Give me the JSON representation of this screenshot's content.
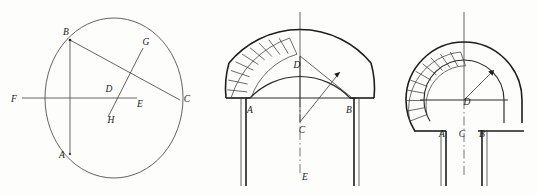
{
  "page": {
    "background": "#fdfdfc",
    "width": 537,
    "height": 195,
    "ink_color": "#1d1d1d",
    "hatch_color": "#3b3b3b"
  },
  "figures": [
    {
      "id": "figure-1-circle-chord-construction",
      "description": "Circle with chord BC, chord AB vertical, diameter line FE horizontal, and perpendicular bisector GH",
      "labels": [
        {
          "key": "A",
          "text": "A",
          "x": 62,
          "y": 158
        },
        {
          "key": "B",
          "text": "B",
          "x": 66,
          "y": 35
        },
        {
          "key": "C",
          "text": "C",
          "x": 187,
          "y": 102
        },
        {
          "key": "D",
          "text": "D",
          "x": 109,
          "y": 92
        },
        {
          "key": "E",
          "text": "E",
          "x": 140,
          "y": 107
        },
        {
          "key": "F",
          "text": "F",
          "x": 14,
          "y": 102
        },
        {
          "key": "G",
          "text": "G",
          "x": 146,
          "y": 45
        },
        {
          "key": "H",
          "text": "H",
          "x": 111,
          "y": 123
        }
      ]
    },
    {
      "id": "figure-2-segmental-arch",
      "description": "Segmental arch on piers, voussoirs hatched on left haunch, radius arrow from centre C, springing points A and B, crown D, vertical axis through E",
      "labels": [
        {
          "key": "A",
          "text": "A",
          "x": 250,
          "y": 113
        },
        {
          "key": "B",
          "text": "B",
          "x": 349,
          "y": 113
        },
        {
          "key": "C",
          "text": "C",
          "x": 302,
          "y": 133
        },
        {
          "key": "D",
          "text": "D",
          "x": 297,
          "y": 68
        },
        {
          "key": "E",
          "text": "E",
          "x": 305,
          "y": 180
        }
      ]
    },
    {
      "id": "figure-3-horseshoe-arch",
      "description": "Horseshoe (stilted) arch on piers with hatched voussoirs on left, centre D with radius arrow, springing A, axis C, springing B",
      "labels": [
        {
          "key": "A",
          "text": "A",
          "x": 442,
          "y": 137
        },
        {
          "key": "B",
          "text": "B",
          "x": 482,
          "y": 137
        },
        {
          "key": "C",
          "text": "C",
          "x": 462,
          "y": 137
        },
        {
          "key": "D",
          "text": "D",
          "x": 467,
          "y": 105
        }
      ]
    }
  ]
}
